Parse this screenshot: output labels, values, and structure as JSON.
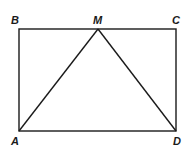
{
  "diagram": {
    "type": "geometry",
    "points": {
      "B": {
        "label": "B",
        "x": 19,
        "y": 29
      },
      "M": {
        "label": "M",
        "x": 98,
        "y": 29
      },
      "C": {
        "label": "C",
        "x": 176,
        "y": 29
      },
      "A": {
        "label": "A",
        "x": 19,
        "y": 131
      },
      "D": {
        "label": "D",
        "x": 176,
        "y": 131
      }
    },
    "segments": [
      "AB",
      "BC",
      "CD",
      "DA",
      "AM",
      "MD"
    ],
    "stroke_color": "#1a1a1a"
  }
}
